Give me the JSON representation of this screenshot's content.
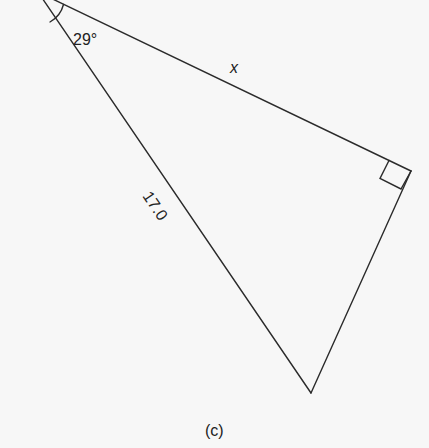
{
  "figure": {
    "caption": "(c)",
    "triangle": {
      "angle_label": "29°",
      "hypotenuse_label": "17.0",
      "unknown_side_label": "x",
      "right_angle_marker": true,
      "vertices": {
        "apex": [
          38,
          -8
        ],
        "right_angle": [
          411,
          171
        ],
        "bottom": [
          311,
          393
        ]
      }
    },
    "colors": {
      "line": "#2b2b2b",
      "background": "#f7f7f7",
      "text": "#222222"
    }
  }
}
